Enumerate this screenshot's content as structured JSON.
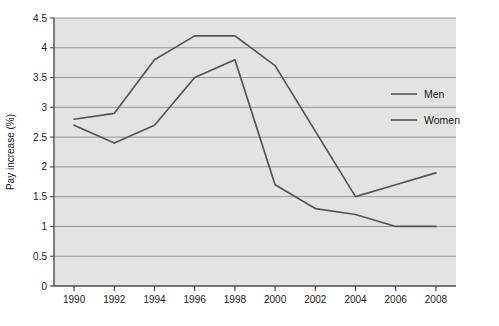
{
  "chart_data": {
    "type": "line",
    "title": "",
    "subtitle": "",
    "xlabel": "",
    "ylabel": "Pay increase (%)",
    "x": [
      1990,
      1992,
      1994,
      1996,
      1998,
      2000,
      2002,
      2004,
      2006,
      2008
    ],
    "categories": [
      "1990",
      "1992",
      "1994",
      "1996",
      "1998",
      "2000",
      "2002",
      "2004",
      "2006",
      "2008"
    ],
    "xlim": [
      1989,
      2009
    ],
    "ylim": [
      0,
      4.5
    ],
    "yticks": [
      0,
      0.5,
      1,
      1.5,
      2,
      2.5,
      3,
      3.5,
      4,
      4.5
    ],
    "ytick_labels": [
      "0",
      "0.5",
      "1",
      "1.5",
      "2",
      "2.5",
      "3",
      "3.5",
      "4",
      "4.5"
    ],
    "grid": "horizontal",
    "legend_position": "right-middle",
    "plot_background": "#e3e3e3",
    "grid_color": "#8c8c8c",
    "frame_color": "#4d4d4d",
    "series": [
      {
        "name": "Men",
        "color": "#555555",
        "values": [
          2.8,
          2.9,
          3.8,
          4.2,
          4.2,
          3.7,
          2.6,
          1.5,
          1.7,
          1.9
        ]
      },
      {
        "name": "Women",
        "color": "#555555",
        "values": [
          2.7,
          2.4,
          2.7,
          3.5,
          3.8,
          1.7,
          1.3,
          1.2,
          1.0,
          1.0
        ]
      }
    ]
  },
  "legend": {
    "entries": [
      {
        "label": "Men"
      },
      {
        "label": "Women"
      }
    ]
  }
}
